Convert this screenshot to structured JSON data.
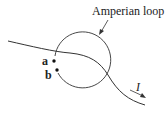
{
  "labels": {
    "loop": "Amperian loop",
    "point_a": "a",
    "point_b": "b",
    "current": "I"
  },
  "colors": {
    "stroke": "#333333",
    "background": "#ffffff"
  }
}
